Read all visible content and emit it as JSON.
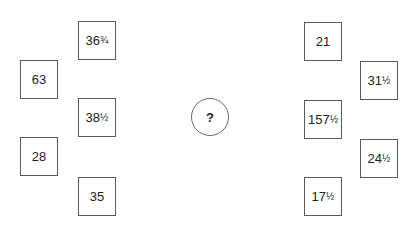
{
  "puzzle": {
    "question_mark": "?",
    "left_boxes": [
      {
        "whole": "36",
        "fraction": "3/4",
        "display": "36¾"
      },
      {
        "whole": "63",
        "fraction": "",
        "display": "63"
      },
      {
        "whole": "38",
        "fraction": "1/2",
        "display": "38½"
      },
      {
        "whole": "28",
        "fraction": "",
        "display": "28"
      },
      {
        "whole": "35",
        "fraction": "",
        "display": "35"
      }
    ],
    "right_boxes": [
      {
        "whole": "21",
        "fraction": "",
        "display": "21"
      },
      {
        "whole": "31",
        "fraction": "1/2",
        "display": "31½"
      },
      {
        "whole": "157",
        "fraction": "1/2",
        "display": "157½"
      },
      {
        "whole": "24",
        "fraction": "1/2",
        "display": "24½"
      },
      {
        "whole": "17",
        "fraction": "1/2",
        "display": "17½"
      }
    ]
  }
}
